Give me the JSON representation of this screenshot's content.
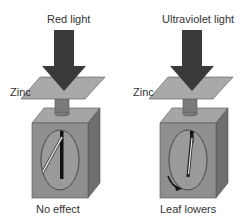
{
  "figure": {
    "panels": [
      {
        "light_label": "Red light",
        "plate_label": "Zinc",
        "result_label": "No effect",
        "leaf_state": "raised"
      },
      {
        "light_label": "Ultraviolet light",
        "plate_label": "Zinc",
        "result_label": "Leaf lowers",
        "leaf_state": "lowered"
      }
    ],
    "colors": {
      "arrow": "#3a3a3a",
      "plate": "#a9a9a9",
      "box_front": "#8f8f8f",
      "box_side": "#6e6e6e",
      "box_top": "#a5a5a5",
      "rod": "#7a7a7a",
      "text": "#333333"
    }
  }
}
